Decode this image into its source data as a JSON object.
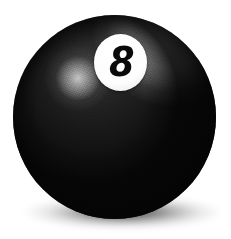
{
  "scene": {
    "title": "Eight Ball",
    "background_color": "#ffffff",
    "width": 231,
    "height": 239
  },
  "ball": {
    "name": "billiard-eight-ball",
    "body_color": "#141414",
    "deep_shadow_color": "#060606",
    "center_x": 114,
    "center_y": 117,
    "diameter": 203,
    "highlight": {
      "name": "diffuse-highlight",
      "color": "#c8c8c8",
      "position": "upper-left"
    },
    "rim_light": {
      "name": "rim-light",
      "color": "#ffffff",
      "position": "upper-right"
    },
    "texture": "grain"
  },
  "number_disc": {
    "name": "number-disc",
    "fill_color": "#ffffff",
    "number": "8",
    "number_color": "#0a0a0a",
    "diameter": 53,
    "center_x": 107,
    "center_y": 47
  },
  "cast_shadow": {
    "name": "cast-shadow",
    "color": "#000000",
    "opacity": "0.72",
    "center_x": 119,
    "center_y": 213
  }
}
